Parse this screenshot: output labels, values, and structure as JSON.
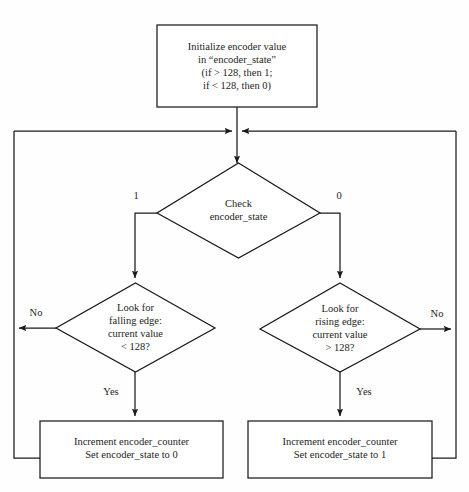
{
  "diagram": {
    "colors": {
      "stroke": "#1a1a1a",
      "text": "#242424",
      "background": "#fefefe",
      "node_fill": "#ffffff"
    },
    "nodes": {
      "init": {
        "type": "process",
        "lines": [
          "Initialize encoder value",
          "in “encoder_state”",
          "(if > 128, then 1;",
          "if < 128, then 0)"
        ]
      },
      "check": {
        "type": "decision",
        "lines": [
          "Check",
          "encoder_state"
        ]
      },
      "falling": {
        "type": "decision",
        "lines": [
          "Look for",
          "falling edge:",
          "current value",
          "< 128?"
        ]
      },
      "rising": {
        "type": "decision",
        "lines": [
          "Look for",
          "rising edge:",
          "current value",
          "> 128?"
        ]
      },
      "increment_left": {
        "type": "process",
        "lines": [
          "Increment encoder_counter",
          "Set encoder_state to 0"
        ]
      },
      "increment_right": {
        "type": "process",
        "lines": [
          "Increment encoder_counter",
          "Set encoder_state to 1"
        ]
      }
    },
    "edge_labels": {
      "check_left": "1",
      "check_right": "0",
      "falling_no": "No",
      "falling_yes": "Yes",
      "rising_no": "No",
      "rising_yes": "Yes"
    }
  }
}
